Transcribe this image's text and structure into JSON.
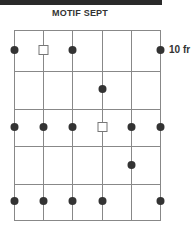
{
  "title": "MOTIF SEPT",
  "label": "10 fr",
  "grid": {
    "columns_x": [
      14,
      43,
      72,
      102,
      131,
      160
    ],
    "rows_y": [
      30,
      71,
      109,
      146,
      184,
      220
    ],
    "line_color": "#888888",
    "dot_color": "#333333"
  },
  "markers": [
    {
      "type": "dot",
      "col": 0,
      "y": 50
    },
    {
      "type": "square",
      "col": 1,
      "y": 50
    },
    {
      "type": "dot",
      "col": 2,
      "y": 50
    },
    {
      "type": "dot",
      "col": 5,
      "y": 50
    },
    {
      "type": "dot",
      "col": 3,
      "y": 89
    },
    {
      "type": "dot",
      "col": 0,
      "y": 127
    },
    {
      "type": "dot",
      "col": 1,
      "y": 127
    },
    {
      "type": "dot",
      "col": 2,
      "y": 127
    },
    {
      "type": "square",
      "col": 3,
      "y": 127
    },
    {
      "type": "dot",
      "col": 4,
      "y": 127
    },
    {
      "type": "dot",
      "col": 5,
      "y": 127
    },
    {
      "type": "dot",
      "col": 4,
      "y": 165
    },
    {
      "type": "dot",
      "col": 0,
      "y": 201
    },
    {
      "type": "dot",
      "col": 1,
      "y": 201
    },
    {
      "type": "dot",
      "col": 2,
      "y": 201
    },
    {
      "type": "dot",
      "col": 3,
      "y": 201
    },
    {
      "type": "dot",
      "col": 5,
      "y": 201
    }
  ]
}
